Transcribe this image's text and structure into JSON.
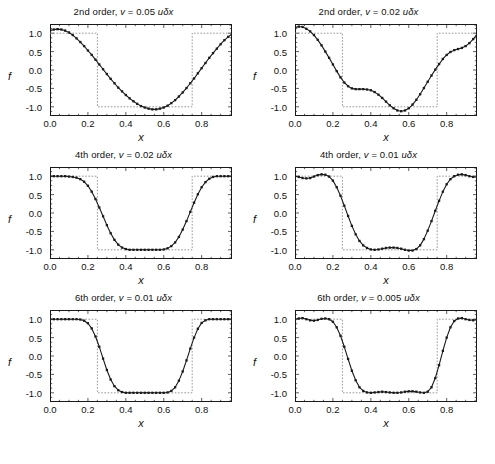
{
  "figure": {
    "layout": "2 columns x 3 rows",
    "background": "#ffffff",
    "line_color": "#1a1a1a",
    "reference_color": "#8c8c8c"
  },
  "axes": {
    "xlabel": "x",
    "ylabel": "f",
    "xticks": [
      "0.0",
      "0.2",
      "0.4",
      "0.6",
      "0.8"
    ],
    "xtick_values": [
      0.0,
      0.2,
      0.4,
      0.6,
      0.8
    ],
    "yticks": [
      "1.0",
      "0.5",
      "0.0",
      "-0.5",
      "-1.0"
    ],
    "ytick_values": [
      1.0,
      0.5,
      0.0,
      -0.5,
      -1.0
    ],
    "xlim": [
      0.0,
      0.96
    ],
    "ylim": [
      -1.25,
      1.25
    ]
  },
  "chart_data": {
    "type": "line",
    "title": "",
    "xlabel": "x",
    "ylabel": "f",
    "xlim": [
      0.0,
      0.96
    ],
    "ylim": [
      -1.25,
      1.25
    ],
    "grid": false,
    "legend_position": "none",
    "panels": [
      {
        "id": "panel-2nd-order-005",
        "row": 0,
        "col": 0,
        "title": "2nd order, v = 0.05 uδx",
        "order": "2nd order",
        "nu_label": "v = 0.05 uδx",
        "nu_value": 0.05,
        "series": [
          {
            "name": "exact",
            "style": "dotted",
            "x": [
              0.0,
              0.25,
              0.25,
              0.75,
              0.75,
              0.96
            ],
            "values": [
              1.0,
              1.0,
              -1.0,
              -1.0,
              1.0,
              1.0
            ]
          },
          {
            "name": "numerical",
            "style": "solid-with-markers",
            "x": [
              0.0,
              0.02,
              0.04,
              0.06,
              0.08,
              0.1,
              0.12,
              0.14,
              0.16,
              0.18,
              0.2,
              0.22,
              0.24,
              0.26,
              0.28,
              0.3,
              0.32,
              0.34,
              0.36,
              0.38,
              0.4,
              0.42,
              0.44,
              0.46,
              0.48,
              0.5,
              0.52,
              0.54,
              0.56,
              0.58,
              0.6,
              0.62,
              0.64,
              0.66,
              0.68,
              0.7,
              0.72,
              0.74,
              0.76,
              0.78,
              0.8,
              0.82,
              0.84,
              0.86,
              0.88,
              0.9,
              0.92,
              0.94,
              0.96
            ],
            "values": [
              1.07,
              1.1,
              1.11,
              1.1,
              1.07,
              1.02,
              0.95,
              0.86,
              0.76,
              0.65,
              0.53,
              0.41,
              0.28,
              0.15,
              0.02,
              -0.11,
              -0.24,
              -0.36,
              -0.48,
              -0.58,
              -0.68,
              -0.77,
              -0.85,
              -0.92,
              -0.98,
              -1.02,
              -1.05,
              -1.07,
              -1.07,
              -1.05,
              -1.02,
              -0.97,
              -0.9,
              -0.82,
              -0.72,
              -0.61,
              -0.49,
              -0.36,
              -0.23,
              -0.09,
              0.05,
              0.19,
              0.33,
              0.46,
              0.58,
              0.7,
              0.81,
              0.9,
              0.98
            ]
          }
        ]
      },
      {
        "id": "panel-2nd-order-002",
        "row": 0,
        "col": 1,
        "title": "2nd order, v = 0.02 uδx",
        "order": "2nd order",
        "nu_label": "v = 0.02 uδx",
        "nu_value": 0.02,
        "series": [
          {
            "name": "exact",
            "style": "dotted",
            "x": [
              0.0,
              0.25,
              0.25,
              0.75,
              0.75,
              0.96
            ],
            "values": [
              1.0,
              1.0,
              -1.0,
              -1.0,
              1.0,
              1.0
            ]
          },
          {
            "name": "numerical",
            "style": "solid-with-markers",
            "x": [
              0.0,
              0.02,
              0.04,
              0.06,
              0.08,
              0.1,
              0.12,
              0.14,
              0.16,
              0.18,
              0.2,
              0.22,
              0.24,
              0.26,
              0.28,
              0.3,
              0.32,
              0.34,
              0.36,
              0.38,
              0.4,
              0.42,
              0.44,
              0.46,
              0.48,
              0.5,
              0.52,
              0.54,
              0.56,
              0.58,
              0.6,
              0.62,
              0.64,
              0.66,
              0.68,
              0.7,
              0.72,
              0.74,
              0.76,
              0.78,
              0.8,
              0.82,
              0.84,
              0.86,
              0.88,
              0.9,
              0.92,
              0.94,
              0.96
            ],
            "values": [
              1.15,
              1.18,
              1.17,
              1.12,
              1.05,
              0.95,
              0.82,
              0.67,
              0.5,
              0.33,
              0.15,
              -0.03,
              -0.2,
              -0.34,
              -0.44,
              -0.5,
              -0.52,
              -0.52,
              -0.52,
              -0.53,
              -0.55,
              -0.6,
              -0.67,
              -0.76,
              -0.86,
              -0.96,
              -1.04,
              -1.1,
              -1.12,
              -1.1,
              -1.04,
              -0.94,
              -0.81,
              -0.66,
              -0.49,
              -0.32,
              -0.15,
              0.01,
              0.16,
              0.3,
              0.41,
              0.49,
              0.54,
              0.57,
              0.6,
              0.65,
              0.73,
              0.84,
              0.97
            ]
          }
        ]
      },
      {
        "id": "panel-4th-order-002",
        "row": 1,
        "col": 0,
        "title": "4th order, v = 0.02 uδx",
        "order": "4th order",
        "nu_label": "v = 0.02 uδx",
        "nu_value": 0.02,
        "series": [
          {
            "name": "exact",
            "style": "dotted",
            "x": [
              0.0,
              0.25,
              0.25,
              0.75,
              0.75,
              0.96
            ],
            "values": [
              1.0,
              1.0,
              -1.0,
              -1.0,
              1.0,
              1.0
            ]
          },
          {
            "name": "numerical",
            "style": "solid-with-markers",
            "x": [
              0.0,
              0.02,
              0.04,
              0.06,
              0.08,
              0.1,
              0.12,
              0.14,
              0.16,
              0.18,
              0.2,
              0.22,
              0.24,
              0.26,
              0.28,
              0.3,
              0.32,
              0.34,
              0.36,
              0.38,
              0.4,
              0.42,
              0.44,
              0.46,
              0.48,
              0.5,
              0.52,
              0.54,
              0.56,
              0.58,
              0.6,
              0.62,
              0.64,
              0.66,
              0.68,
              0.7,
              0.72,
              0.74,
              0.76,
              0.78,
              0.8,
              0.82,
              0.84,
              0.86,
              0.88,
              0.9,
              0.92,
              0.94,
              0.96
            ],
            "values": [
              1.0,
              1.0,
              1.0,
              1.0,
              1.0,
              0.99,
              0.98,
              0.96,
              0.92,
              0.85,
              0.74,
              0.58,
              0.38,
              0.15,
              -0.09,
              -0.33,
              -0.55,
              -0.73,
              -0.86,
              -0.94,
              -0.98,
              -1.0,
              -1.0,
              -1.0,
              -1.0,
              -1.0,
              -1.0,
              -1.0,
              -1.0,
              -1.0,
              -0.99,
              -0.96,
              -0.9,
              -0.8,
              -0.65,
              -0.45,
              -0.22,
              0.03,
              0.28,
              0.51,
              0.7,
              0.84,
              0.93,
              0.98,
              1.0,
              1.0,
              1.0,
              1.0,
              1.0
            ]
          }
        ]
      },
      {
        "id": "panel-4th-order-001",
        "row": 1,
        "col": 1,
        "title": "4th order, v = 0.01 uδx",
        "order": "4th order",
        "nu_label": "v = 0.01 uδx",
        "nu_value": 0.01,
        "series": [
          {
            "name": "exact",
            "style": "dotted",
            "x": [
              0.0,
              0.25,
              0.25,
              0.75,
              0.75,
              0.96
            ],
            "values": [
              1.0,
              1.0,
              -1.0,
              -1.0,
              1.0,
              1.0
            ]
          },
          {
            "name": "numerical",
            "style": "solid-with-markers",
            "x": [
              0.0,
              0.02,
              0.04,
              0.06,
              0.08,
              0.1,
              0.12,
              0.14,
              0.16,
              0.18,
              0.2,
              0.22,
              0.24,
              0.26,
              0.28,
              0.3,
              0.32,
              0.34,
              0.36,
              0.38,
              0.4,
              0.42,
              0.44,
              0.46,
              0.48,
              0.5,
              0.52,
              0.54,
              0.56,
              0.58,
              0.6,
              0.62,
              0.64,
              0.66,
              0.68,
              0.7,
              0.72,
              0.74,
              0.76,
              0.78,
              0.8,
              0.82,
              0.84,
              0.86,
              0.88,
              0.9,
              0.92,
              0.94,
              0.96
            ],
            "values": [
              1.0,
              0.98,
              0.95,
              0.94,
              0.95,
              0.99,
              1.03,
              1.05,
              1.04,
              0.99,
              0.88,
              0.7,
              0.47,
              0.2,
              -0.08,
              -0.35,
              -0.58,
              -0.76,
              -0.88,
              -0.95,
              -0.99,
              -1.0,
              -0.99,
              -0.97,
              -0.95,
              -0.94,
              -0.94,
              -0.95,
              -0.97,
              -1.0,
              -1.02,
              -1.02,
              -0.98,
              -0.88,
              -0.71,
              -0.48,
              -0.22,
              0.06,
              0.33,
              0.58,
              0.78,
              0.92,
              1.0,
              1.04,
              1.05,
              1.03,
              1.0,
              0.98,
              0.98
            ]
          }
        ]
      },
      {
        "id": "panel-6th-order-001",
        "row": 2,
        "col": 0,
        "title": "6th order, v = 0.01 uδx",
        "order": "6th order",
        "nu_label": "v = 0.01 uδx",
        "nu_value": 0.01,
        "series": [
          {
            "name": "exact",
            "style": "dotted",
            "x": [
              0.0,
              0.25,
              0.25,
              0.75,
              0.75,
              0.96
            ],
            "values": [
              1.0,
              1.0,
              -1.0,
              -1.0,
              1.0,
              1.0
            ]
          },
          {
            "name": "numerical",
            "style": "solid-with-markers",
            "x": [
              0.0,
              0.02,
              0.04,
              0.06,
              0.08,
              0.1,
              0.12,
              0.14,
              0.16,
              0.18,
              0.2,
              0.22,
              0.24,
              0.26,
              0.28,
              0.3,
              0.32,
              0.34,
              0.36,
              0.38,
              0.4,
              0.42,
              0.44,
              0.46,
              0.48,
              0.5,
              0.52,
              0.54,
              0.56,
              0.58,
              0.6,
              0.62,
              0.64,
              0.66,
              0.68,
              0.7,
              0.72,
              0.74,
              0.76,
              0.78,
              0.8,
              0.82,
              0.84,
              0.86,
              0.88,
              0.9,
              0.92,
              0.94,
              0.96
            ],
            "values": [
              1.0,
              1.0,
              1.0,
              1.0,
              1.0,
              1.0,
              1.0,
              1.0,
              0.99,
              0.96,
              0.89,
              0.75,
              0.53,
              0.25,
              -0.07,
              -0.38,
              -0.64,
              -0.82,
              -0.93,
              -0.98,
              -1.0,
              -1.0,
              -1.0,
              -1.0,
              -1.0,
              -1.0,
              -1.0,
              -1.0,
              -1.0,
              -1.0,
              -1.0,
              -0.99,
              -0.95,
              -0.85,
              -0.67,
              -0.42,
              -0.12,
              0.2,
              0.5,
              0.74,
              0.9,
              0.97,
              1.0,
              1.0,
              1.0,
              1.0,
              1.0,
              1.0,
              1.0
            ]
          }
        ]
      },
      {
        "id": "panel-6th-order-0005",
        "row": 2,
        "col": 1,
        "title": "6th order, v = 0.005 uδx",
        "order": "6th order",
        "nu_label": "v = 0.005 uδx",
        "nu_value": 0.005,
        "series": [
          {
            "name": "exact",
            "style": "dotted",
            "x": [
              0.0,
              0.25,
              0.25,
              0.75,
              0.75,
              0.96
            ],
            "values": [
              1.0,
              1.0,
              -1.0,
              -1.0,
              1.0,
              1.0
            ]
          },
          {
            "name": "numerical",
            "style": "solid-with-markers",
            "x": [
              0.0,
              0.02,
              0.04,
              0.06,
              0.08,
              0.1,
              0.12,
              0.14,
              0.16,
              0.18,
              0.2,
              0.22,
              0.24,
              0.26,
              0.28,
              0.3,
              0.32,
              0.34,
              0.36,
              0.38,
              0.4,
              0.42,
              0.44,
              0.46,
              0.48,
              0.5,
              0.52,
              0.54,
              0.56,
              0.58,
              0.6,
              0.62,
              0.64,
              0.66,
              0.68,
              0.7,
              0.72,
              0.74,
              0.76,
              0.78,
              0.8,
              0.82,
              0.84,
              0.86,
              0.88,
              0.9,
              0.92,
              0.94,
              0.96
            ],
            "values": [
              1.0,
              1.02,
              1.03,
              1.0,
              0.97,
              0.96,
              0.98,
              1.01,
              1.02,
              1.0,
              0.93,
              0.78,
              0.55,
              0.25,
              -0.08,
              -0.4,
              -0.66,
              -0.85,
              -0.95,
              -0.99,
              -1.0,
              -0.99,
              -0.98,
              -0.97,
              -0.98,
              -0.99,
              -1.0,
              -1.0,
              -0.99,
              -0.97,
              -0.96,
              -0.96,
              -0.97,
              -0.99,
              -1.0,
              -0.97,
              -0.85,
              -0.6,
              -0.25,
              0.14,
              0.5,
              0.78,
              0.95,
              1.02,
              1.03,
              1.0,
              0.98,
              0.97,
              0.99
            ]
          }
        ]
      }
    ]
  }
}
